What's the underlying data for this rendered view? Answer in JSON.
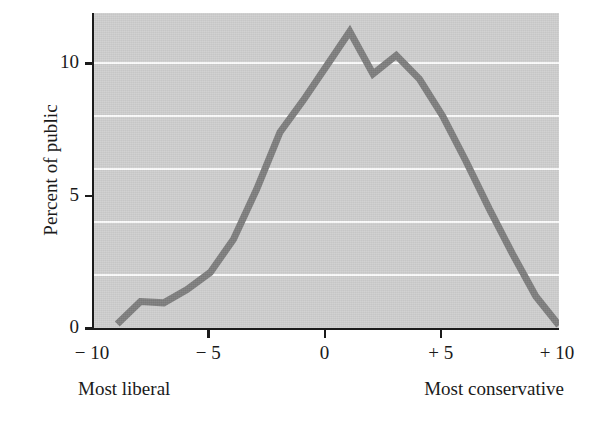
{
  "chart_data": {
    "type": "line",
    "title": "",
    "xlabel": "",
    "ylabel": "Percent of public",
    "xlim": [
      -10,
      10
    ],
    "ylim": [
      0,
      11.9
    ],
    "grid": true,
    "gridlines_y": [
      2,
      4,
      6,
      8,
      10
    ],
    "legend": "none",
    "series": [
      {
        "name": "Distribution of public ideology",
        "color": "#7c7c7c",
        "x": [
          -9,
          -8,
          -7,
          -6,
          -5,
          -4,
          -3,
          -2,
          -1,
          0,
          1,
          2,
          3,
          4,
          5,
          6,
          7,
          8,
          9,
          10
        ],
        "values": [
          0.15,
          1.0,
          0.95,
          1.45,
          2.1,
          3.35,
          5.25,
          7.4,
          8.6,
          9.9,
          11.2,
          9.6,
          10.3,
          9.4,
          8.0,
          6.3,
          4.5,
          2.8,
          1.2,
          0.1
        ]
      }
    ],
    "x_ticks": [
      {
        "value": -10,
        "label": "− 10"
      },
      {
        "value": -5,
        "label": "− 5"
      },
      {
        "value": 0,
        "label": "0"
      },
      {
        "value": 5,
        "label": "+ 5"
      },
      {
        "value": 10,
        "label": "+ 10"
      }
    ],
    "y_ticks": [
      {
        "value": 0,
        "label": "0"
      },
      {
        "value": 5,
        "label": "5"
      },
      {
        "value": 10,
        "label": "10"
      }
    ],
    "annotations": {
      "left_end_label": "Most liberal",
      "right_end_label": "Most conservative"
    },
    "colors": {
      "line": "#7c7c7c",
      "plot_background": "#cdcdcd",
      "gridline": "#fbfbfb",
      "axis": "#1b1b1b",
      "page_background": "#ffffff",
      "text": "#1a1a1a"
    }
  }
}
